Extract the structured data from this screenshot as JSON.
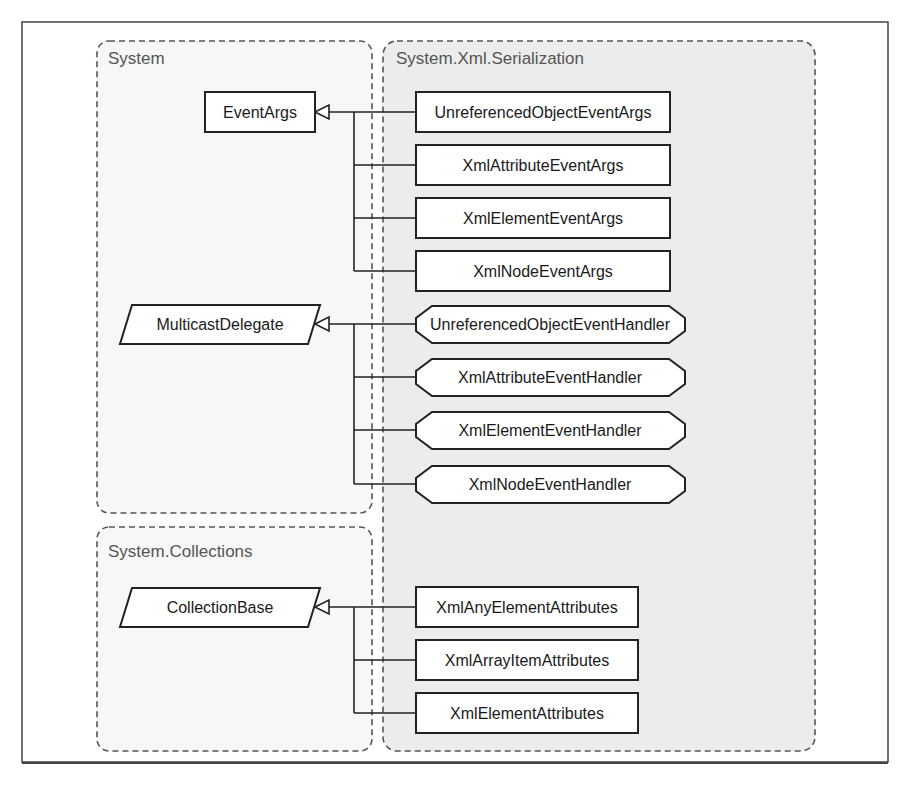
{
  "diagram": {
    "type": "class-hierarchy",
    "namespaces": [
      {
        "id": "system",
        "title": "System"
      },
      {
        "id": "serialization",
        "title": "System.Xml.Serialization"
      },
      {
        "id": "collections",
        "title": "System.Collections"
      }
    ],
    "base_types": [
      {
        "id": "eventargs",
        "label": "EventArgs",
        "namespace": "System",
        "shape": "rectangle"
      },
      {
        "id": "multicastdelegate",
        "label": "MulticastDelegate",
        "namespace": "System",
        "shape": "parallelogram"
      },
      {
        "id": "collectionbase",
        "label": "CollectionBase",
        "namespace": "System.Collections",
        "shape": "parallelogram"
      }
    ],
    "event_args": [
      {
        "label": "UnreferencedObjectEventArgs",
        "inherits": "EventArgs"
      },
      {
        "label": "XmlAttributeEventArgs",
        "inherits": "EventArgs"
      },
      {
        "label": "XmlElementEventArgs",
        "inherits": "EventArgs"
      },
      {
        "label": "XmlNodeEventArgs",
        "inherits": "EventArgs"
      }
    ],
    "event_handlers": [
      {
        "label": "UnreferencedObjectEventHandler",
        "inherits": "MulticastDelegate"
      },
      {
        "label": "XmlAttributeEventHandler",
        "inherits": "MulticastDelegate"
      },
      {
        "label": "XmlElementEventHandler",
        "inherits": "MulticastDelegate"
      },
      {
        "label": "XmlNodeEventHandler",
        "inherits": "MulticastDelegate"
      }
    ],
    "collections": [
      {
        "label": "XmlAnyElementAttributes",
        "inherits": "CollectionBase"
      },
      {
        "label": "XmlArrayItemAttributes",
        "inherits": "CollectionBase"
      },
      {
        "label": "XmlElementAttributes",
        "inherits": "CollectionBase"
      }
    ]
  },
  "colors": {
    "frame": "#444444",
    "namespace_border": "#555555",
    "system_fill": "#f7f7f7",
    "serialization_fill": "#ececec",
    "node_fill": "#ffffff",
    "node_stroke": "#222222"
  }
}
